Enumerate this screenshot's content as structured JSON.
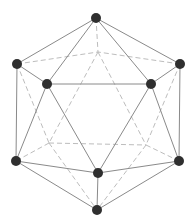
{
  "diagram": {
    "type": "icosahedron-wireframe",
    "colors": {
      "background": "#ffffff",
      "vertex": "#2f2f2f",
      "visible_edge": "#8a8a8a",
      "hidden_edge": "#bdbdbd"
    },
    "vertex_radius": 5,
    "vertices": [
      {
        "id": "T",
        "x": 96,
        "y": 18,
        "visible": true
      },
      {
        "id": "L",
        "x": 17,
        "y": 64,
        "visible": true
      },
      {
        "id": "R",
        "x": 180,
        "y": 64,
        "visible": true
      },
      {
        "id": "IL",
        "x": 47,
        "y": 84,
        "visible": true
      },
      {
        "id": "IR",
        "x": 151,
        "y": 84,
        "visible": true
      },
      {
        "id": "B0",
        "x": 98,
        "y": 52,
        "visible": false
      },
      {
        "id": "BL",
        "x": 16,
        "y": 161,
        "visible": true
      },
      {
        "id": "BR",
        "x": 179,
        "y": 161,
        "visible": true
      },
      {
        "id": "F",
        "x": 98,
        "y": 173,
        "visible": true
      },
      {
        "id": "HBL",
        "x": 49,
        "y": 143,
        "visible": false
      },
      {
        "id": "HBR",
        "x": 146,
        "y": 145,
        "visible": false
      },
      {
        "id": "Bot",
        "x": 97,
        "y": 210,
        "visible": true
      }
    ],
    "solid_edges": [
      [
        "T",
        "L"
      ],
      [
        "T",
        "IL"
      ],
      [
        "T",
        "IR"
      ],
      [
        "T",
        "R"
      ],
      [
        "L",
        "IL"
      ],
      [
        "IL",
        "IR"
      ],
      [
        "IR",
        "R"
      ],
      [
        "L",
        "BL"
      ],
      [
        "IL",
        "BL"
      ],
      [
        "IL",
        "F"
      ],
      [
        "IR",
        "F"
      ],
      [
        "IR",
        "BR"
      ],
      [
        "R",
        "BR"
      ],
      [
        "BL",
        "F"
      ],
      [
        "F",
        "BR"
      ],
      [
        "BL",
        "Bot"
      ],
      [
        "F",
        "Bot"
      ],
      [
        "BR",
        "Bot"
      ]
    ],
    "dashed_edges": [
      [
        "T",
        "B0"
      ],
      [
        "L",
        "B0"
      ],
      [
        "R",
        "B0"
      ],
      [
        "B0",
        "HBL"
      ],
      [
        "B0",
        "HBR"
      ],
      [
        "L",
        "HBL"
      ],
      [
        "R",
        "HBR"
      ],
      [
        "HBL",
        "HBR"
      ],
      [
        "HBL",
        "BL"
      ],
      [
        "HBR",
        "BR"
      ],
      [
        "HBL",
        "Bot"
      ],
      [
        "HBR",
        "Bot"
      ]
    ]
  }
}
